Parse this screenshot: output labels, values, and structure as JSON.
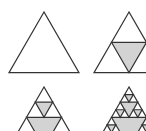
{
  "diagram": {
    "colors": {
      "stroke": "#333333",
      "fill_removed": "#d3d3d3",
      "background": "#ffffff"
    },
    "panels": [
      {
        "name": "iteration-0",
        "level": 0,
        "apex": [
          44,
          12
        ],
        "side": 70
      },
      {
        "name": "iteration-1",
        "level": 1,
        "apex": [
          129,
          12
        ],
        "side": 70
      },
      {
        "name": "iteration-2",
        "level": 2,
        "apex": [
          44,
          87
        ],
        "side": 70
      },
      {
        "name": "iteration-3",
        "level": 3,
        "apex": [
          129,
          87
        ],
        "side": 70
      }
    ]
  }
}
